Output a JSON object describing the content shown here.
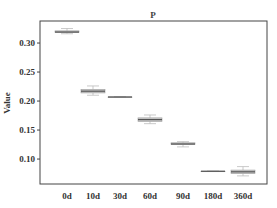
{
  "chart_data": {
    "type": "box",
    "title": "P",
    "xlabel": "",
    "ylabel": "Value",
    "ylim": [
      0.057,
      0.338
    ],
    "yticks": [
      0.1,
      0.15,
      0.2,
      0.25,
      0.3
    ],
    "ytick_labels": [
      "0.10",
      "0.15",
      "0.20",
      "0.25",
      "0.30"
    ],
    "grid": false,
    "legend": null,
    "categories": [
      "0d",
      "10d",
      "30d",
      "60d",
      "90d",
      "180d",
      "360d"
    ],
    "boxes": [
      {
        "category": "0d",
        "whislo": 0.316,
        "q1": 0.318,
        "median": 0.319,
        "q3": 0.321,
        "whishi": 0.325
      },
      {
        "category": "10d",
        "whislo": 0.21,
        "q1": 0.214,
        "median": 0.217,
        "q3": 0.22,
        "whishi": 0.226
      },
      {
        "category": "30d",
        "whislo": 0.207,
        "q1": 0.207,
        "median": 0.207,
        "q3": 0.207,
        "whishi": 0.207
      },
      {
        "category": "60d",
        "whislo": 0.161,
        "q1": 0.165,
        "median": 0.168,
        "q3": 0.171,
        "whishi": 0.176
      },
      {
        "category": "90d",
        "whislo": 0.121,
        "q1": 0.125,
        "median": 0.126,
        "q3": 0.128,
        "whishi": 0.13
      },
      {
        "category": "180d",
        "whislo": 0.079,
        "q1": 0.079,
        "median": 0.079,
        "q3": 0.079,
        "whishi": 0.079
      },
      {
        "category": "360d",
        "whislo": 0.071,
        "q1": 0.075,
        "median": 0.078,
        "q3": 0.081,
        "whishi": 0.087
      }
    ],
    "colors": {
      "box_fill": "#c8c8c8",
      "box_edge": "#9a9a9a",
      "median": "#555555",
      "whisker": "#bbbbbb",
      "axis": "#444444"
    }
  }
}
